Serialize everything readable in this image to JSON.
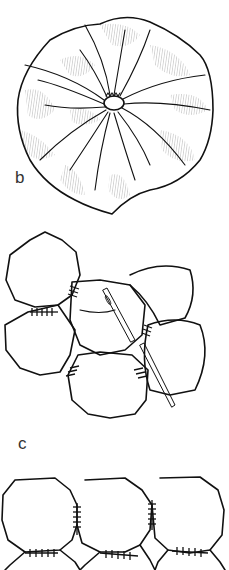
{
  "figure": {
    "panels": [
      {
        "id": "b",
        "label": "b",
        "description": "Gathered fabric circle (yo-yo) viewed from front, with pleats radiating from center"
      },
      {
        "id": "c",
        "label": "c",
        "description": "Yo-yos whipstitched together at touching edges, needle and thread shown"
      },
      {
        "id": "d",
        "label": "",
        "description": "Row of yo-yos joined in a grid with stitches"
      }
    ],
    "colors": {
      "line": "#111111",
      "hatch": "#777777",
      "background": "#ffffff"
    }
  }
}
